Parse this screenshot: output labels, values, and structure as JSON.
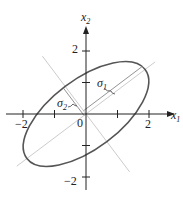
{
  "diagram": {
    "type": "ellipse-principal-axes",
    "axes": {
      "x_label": "x",
      "x_sub": "1",
      "y_label": "x",
      "y_sub": "2",
      "origin_label": "0",
      "x_ticks": [
        -2,
        -1,
        1,
        2
      ],
      "x_tick_labels": [
        {
          "value": -2,
          "text": "−2"
        },
        {
          "value": 2,
          "text": "2"
        }
      ],
      "y_ticks": [
        -2,
        -1,
        1,
        2
      ],
      "y_tick_labels": [
        {
          "value": 2,
          "text": "2"
        },
        {
          "value": -2,
          "text": "−2"
        }
      ]
    },
    "ellipse": {
      "center": [
        0,
        0
      ],
      "semi_major": 2.35,
      "semi_minor": 1.1,
      "rotation_deg": 37
    },
    "annotations": {
      "sigma1": {
        "symbol": "σ",
        "sub": "1"
      },
      "sigma2": {
        "symbol": "σ",
        "sub": "2"
      }
    },
    "colors": {
      "axis": "#222222",
      "ellipse": "#555555",
      "principal_axis": "#cccccc"
    }
  }
}
